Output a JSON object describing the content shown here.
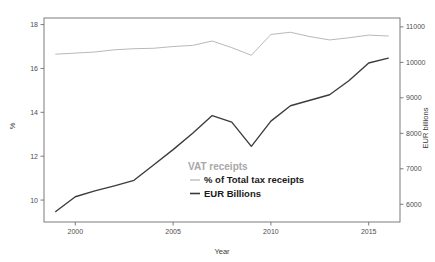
{
  "chart_data": {
    "type": "line",
    "title": "",
    "xlabel": "Year",
    "ylabel": "%",
    "y2label": "EUR billions",
    "xlim": [
      1998.4,
      2016.6
    ],
    "ylim": [
      9.0,
      18.3
    ],
    "y2lim": [
      5500,
      11250
    ],
    "grid": false,
    "legend_position": "inside-center-lower",
    "legend_title": "VAT receipts",
    "x_ticks": [
      2000,
      2005,
      2010,
      2015
    ],
    "x_tick_labels": [
      "2000",
      "2005",
      "2010",
      "2015"
    ],
    "y_ticks": [
      10,
      12,
      14,
      16,
      18
    ],
    "y_tick_labels": [
      "10",
      "12",
      "14",
      "16",
      "18"
    ],
    "y2_ticks": [
      6000,
      7000,
      8000,
      9000,
      10000,
      11000
    ],
    "y2_tick_labels": [
      "6000",
      "7000",
      "8000",
      "9000",
      "10000",
      "11000"
    ],
    "x": [
      1999,
      2000,
      2001,
      2002,
      2003,
      2004,
      2005,
      2006,
      2007,
      2008,
      2009,
      2010,
      2011,
      2012,
      2013,
      2014,
      2015,
      2016
    ],
    "series": [
      {
        "name": "% of Total tax receipts",
        "axis": "left",
        "color": "#b9b9b9",
        "values": [
          16.65,
          16.7,
          16.75,
          16.85,
          16.9,
          16.92,
          17.0,
          17.05,
          17.25,
          16.95,
          16.6,
          17.55,
          17.65,
          17.45,
          17.3,
          17.4,
          17.52,
          17.48
        ]
      },
      {
        "name": "EUR Billions",
        "axis": "right",
        "color": "#3b3b3b",
        "values": [
          9.48,
          10.15,
          10.42,
          10.65,
          10.9,
          11.6,
          12.3,
          13.05,
          13.85,
          13.55,
          12.45,
          13.6,
          14.3,
          14.55,
          14.8,
          15.45,
          16.25,
          16.47
        ]
      }
    ],
    "legend_entries": [
      {
        "label": "% of Total tax receipts",
        "color": "#b9b9b9"
      },
      {
        "label": "EUR Billions",
        "color": "#3b3b3b"
      }
    ]
  },
  "axes": {
    "frame_color": "#6e6e6e"
  }
}
